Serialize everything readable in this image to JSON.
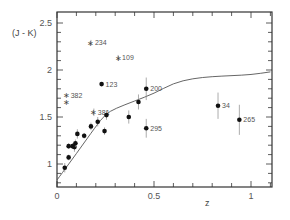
{
  "chart_data": {
    "type": "scatter",
    "title": "",
    "xlabel": "z",
    "ylabel": "(J - K)",
    "xlim": [
      0,
      1.1
    ],
    "ylim": [
      0.76,
      2.55
    ],
    "x_ticks": [
      {
        "value": 0,
        "label": "0"
      },
      {
        "value": 0.5,
        "label": "0.5"
      },
      {
        "value": 1,
        "label": "1"
      }
    ],
    "y_ticks": [
      {
        "value": 1,
        "label": "1"
      },
      {
        "value": 1.5,
        "label": "1.5"
      },
      {
        "value": 2,
        "label": "2"
      },
      {
        "value": 2.5,
        "label": "2.5"
      }
    ],
    "x_minor_step": 0.1,
    "y_minor_step": 0.1,
    "grid": false,
    "legend": null,
    "series": [
      {
        "name": "labeled dots",
        "marker": "dot",
        "points": [
          {
            "x": 0.23,
            "y": 1.85,
            "err": 0.0,
            "label": "123"
          },
          {
            "x": 0.46,
            "y": 1.8,
            "err": 0.12,
            "label": "200"
          },
          {
            "x": 0.46,
            "y": 1.38,
            "err": 0.1,
            "label": "295"
          },
          {
            "x": 0.83,
            "y": 1.62,
            "err": 0.14,
            "label": "34"
          },
          {
            "x": 0.94,
            "y": 1.47,
            "err": 0.16,
            "label": "265"
          }
        ]
      },
      {
        "name": "stars",
        "marker": "star",
        "points": [
          {
            "x": 0.175,
            "y": 2.29,
            "err": 0.03,
            "label": "234"
          },
          {
            "x": 0.315,
            "y": 2.13,
            "err": 0.03,
            "label": "109"
          },
          {
            "x": 0.05,
            "y": 1.73,
            "err": 0.0,
            "label": "382"
          },
          {
            "x": 0.05,
            "y": 1.66,
            "err": 0.0,
            "label": ""
          },
          {
            "x": 0.19,
            "y": 1.55,
            "err": 0.04,
            "label": "381"
          }
        ]
      },
      {
        "name": "unlabeled dots",
        "marker": "dot",
        "points": [
          {
            "x": 0.04,
            "y": 0.96,
            "err": 0.05,
            "label": ""
          },
          {
            "x": 0.06,
            "y": 1.07,
            "err": 0.03,
            "label": ""
          },
          {
            "x": 0.06,
            "y": 1.19,
            "err": 0.03,
            "label": ""
          },
          {
            "x": 0.08,
            "y": 1.19,
            "err": 0.03,
            "label": ""
          },
          {
            "x": 0.09,
            "y": 1.18,
            "err": 0.05,
            "label": ""
          },
          {
            "x": 0.095,
            "y": 1.22,
            "err": 0.04,
            "label": ""
          },
          {
            "x": 0.105,
            "y": 1.32,
            "err": 0.05,
            "label": ""
          },
          {
            "x": 0.14,
            "y": 1.3,
            "err": 0.03,
            "label": ""
          },
          {
            "x": 0.175,
            "y": 1.4,
            "err": 0.04,
            "label": ""
          },
          {
            "x": 0.21,
            "y": 1.45,
            "err": 0.05,
            "label": ""
          },
          {
            "x": 0.245,
            "y": 1.35,
            "err": 0.04,
            "label": ""
          },
          {
            "x": 0.255,
            "y": 1.52,
            "err": 0.05,
            "label": ""
          },
          {
            "x": 0.37,
            "y": 1.5,
            "err": 0.07,
            "label": ""
          },
          {
            "x": 0.42,
            "y": 1.66,
            "err": 0.08,
            "label": ""
          }
        ]
      }
    ],
    "curve": {
      "name": "model",
      "points": [
        [
          0.0,
          0.83
        ],
        [
          0.1,
          1.11
        ],
        [
          0.2,
          1.4
        ],
        [
          0.25,
          1.53
        ],
        [
          0.3,
          1.59
        ],
        [
          0.4,
          1.67
        ],
        [
          0.5,
          1.75
        ],
        [
          0.6,
          1.86
        ],
        [
          0.7,
          1.91
        ],
        [
          0.8,
          1.93
        ],
        [
          0.9,
          1.94
        ],
        [
          1.0,
          1.95
        ],
        [
          1.1,
          1.98
        ]
      ]
    }
  }
}
